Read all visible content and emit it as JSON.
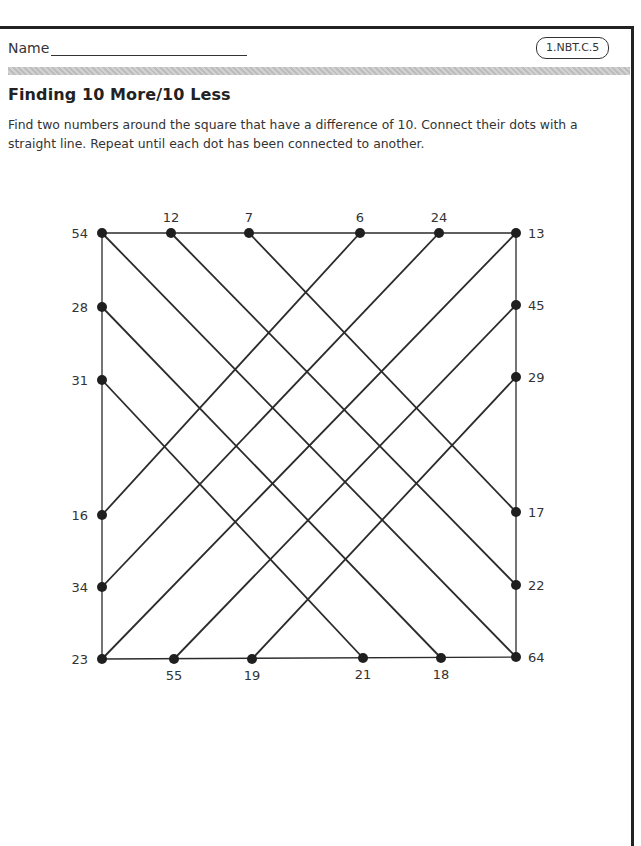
{
  "header": {
    "name_label": "Name",
    "standard_badge": "1.NBT.C.5"
  },
  "worksheet": {
    "title": "Finding 10 More/10 Less",
    "instructions": "Find two numbers around the square that have a difference of 10. Connect their dots with a straight line. Repeat until each dot has been connected to another."
  },
  "puzzle": {
    "colors": {
      "line": "#2b2b2b",
      "dot": "#1f1f1f",
      "label": "#333333"
    },
    "dots": [
      {
        "id": "d54",
        "value": "54",
        "side": "corner-top-left",
        "x": 102,
        "y": 233
      },
      {
        "id": "d12",
        "value": "12",
        "side": "top",
        "x": 171,
        "y": 233
      },
      {
        "id": "d7",
        "value": "7",
        "side": "top",
        "x": 249,
        "y": 233
      },
      {
        "id": "d6",
        "value": "6",
        "side": "top",
        "x": 360,
        "y": 233
      },
      {
        "id": "d24",
        "value": "24",
        "side": "top",
        "x": 439,
        "y": 233
      },
      {
        "id": "d13",
        "value": "13",
        "side": "corner-top-right",
        "x": 516,
        "y": 233
      },
      {
        "id": "d28",
        "value": "28",
        "side": "left",
        "x": 102,
        "y": 307
      },
      {
        "id": "d31",
        "value": "31",
        "side": "left",
        "x": 102,
        "y": 380
      },
      {
        "id": "d16",
        "value": "16",
        "side": "left",
        "x": 102,
        "y": 515
      },
      {
        "id": "d34",
        "value": "34",
        "side": "left",
        "x": 102,
        "y": 587
      },
      {
        "id": "d23",
        "value": "23",
        "side": "corner-bottom-left",
        "x": 102,
        "y": 659
      },
      {
        "id": "d45",
        "value": "45",
        "side": "right",
        "x": 516,
        "y": 305
      },
      {
        "id": "d29",
        "value": "29",
        "side": "right",
        "x": 516,
        "y": 377
      },
      {
        "id": "d17",
        "value": "17",
        "side": "right",
        "x": 516,
        "y": 512
      },
      {
        "id": "d22",
        "value": "22",
        "side": "right",
        "x": 516,
        "y": 585
      },
      {
        "id": "d64",
        "value": "64",
        "side": "corner-bottom-right",
        "x": 516,
        "y": 657
      },
      {
        "id": "d55",
        "value": "55",
        "side": "bottom",
        "x": 174,
        "y": 659
      },
      {
        "id": "d19",
        "value": "19",
        "side": "bottom",
        "x": 252,
        "y": 659
      },
      {
        "id": "d21",
        "value": "21",
        "side": "bottom",
        "x": 363,
        "y": 658
      },
      {
        "id": "d18",
        "value": "18",
        "side": "bottom",
        "x": 441,
        "y": 658
      }
    ],
    "connections": [
      {
        "from": "54",
        "to": "64"
      },
      {
        "from": "12",
        "to": "22"
      },
      {
        "from": "7",
        "to": "17"
      },
      {
        "from": "6",
        "to": "16"
      },
      {
        "from": "24",
        "to": "34"
      },
      {
        "from": "13",
        "to": "23"
      },
      {
        "from": "28",
        "to": "18"
      },
      {
        "from": "31",
        "to": "21"
      },
      {
        "from": "45",
        "to": "55"
      },
      {
        "from": "29",
        "to": "19"
      }
    ]
  }
}
